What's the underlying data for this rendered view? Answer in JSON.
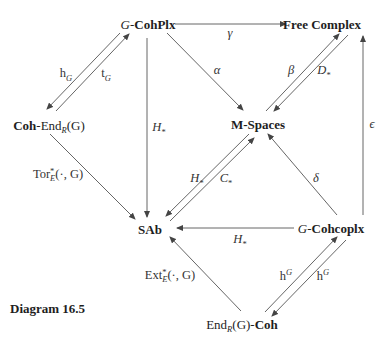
{
  "caption": "Diagram 16.5",
  "nodes": {
    "g_cohplx": {
      "prefix": "G",
      "sep": "-",
      "name": "CohPlx"
    },
    "free_complex": {
      "name": "Free Complex"
    },
    "coh_end": {
      "name": "Coh",
      "sep": "-End",
      "sub": "R",
      "arg": "(G)"
    },
    "m_spaces": {
      "name": "M-Spaces"
    },
    "sab": {
      "name": "SAb"
    },
    "g_cohcoplx": {
      "prefix": "G",
      "sep": "-",
      "name": "Cohcoplx"
    },
    "end_coh": {
      "pre": "End",
      "sub": "R",
      "arg": "(G)-",
      "name": "Coh"
    }
  },
  "labels": {
    "gamma": "γ",
    "alpha": "α",
    "beta": "β",
    "d_star": {
      "base": "D",
      "sub": "*"
    },
    "h_lower_g": {
      "base": "h",
      "sub": "G"
    },
    "t_lower_g": {
      "base": "t",
      "sub": "G"
    },
    "h_star_vertical": {
      "base": "H",
      "sub": "*"
    },
    "tor": {
      "base": "Tor",
      "sup": "*",
      "sub": "E",
      "arg": "(·, G)"
    },
    "h_star_diag": {
      "base": "H",
      "sub": "*"
    },
    "c_star": {
      "base": "C",
      "sub": "*"
    },
    "delta": "δ",
    "epsilon": "ϵ",
    "h_star_horizontal": {
      "base": "H",
      "sub": "*"
    },
    "ext": {
      "base": "Ext",
      "sup": "*",
      "sub": "E",
      "arg": "(·, G)"
    },
    "h_upper_g_left": {
      "base": "h",
      "sup": "G"
    },
    "h_upper_g_right": {
      "base": "h",
      "sup": "G"
    }
  },
  "colors": {
    "line": "#555555",
    "text": "#1e1e1e"
  }
}
